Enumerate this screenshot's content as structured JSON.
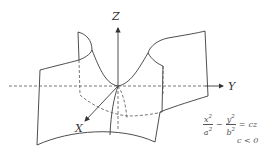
{
  "figure": {
    "axes": {
      "x_label": "X",
      "y_label": "Y",
      "z_label": "Z"
    },
    "equation": {
      "term1_num": "x",
      "term1_num_exp": "2",
      "term1_den": "a",
      "term1_den_exp": "2",
      "minus": "−",
      "term2_num": "y",
      "term2_num_exp": "2",
      "term2_den": "b",
      "term2_den_exp": "2",
      "equals": "=",
      "rhs": "cz"
    },
    "condition": "c < 0",
    "colors": {
      "line": "#3a3a3a",
      "dashed": "#555555",
      "background": "#ffffff"
    }
  }
}
